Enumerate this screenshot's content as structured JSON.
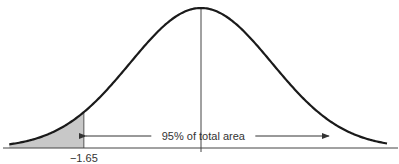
{
  "chart_data": {
    "type": "area",
    "title": "",
    "distribution": "standard normal",
    "mean": 0,
    "sd": 1,
    "xlabel": "",
    "ylabel": "",
    "xlim": [
      -2.75,
      2.75
    ],
    "shaded_region": {
      "from": -2.75,
      "to": -1.65,
      "color": "#c8c8c8"
    },
    "critical_value": -1.65,
    "tick_labels": [
      {
        "x": -1.65,
        "label": "−1.65"
      }
    ],
    "annotations": [
      {
        "text": "95% of total area",
        "from": -1.65,
        "to": 1.8,
        "type": "double-arrow"
      }
    ],
    "center_line": 0,
    "colors": {
      "curve": "#1a1a1a",
      "axis": "#444444",
      "shade": "#c8c8c8",
      "text": "#333333"
    }
  }
}
